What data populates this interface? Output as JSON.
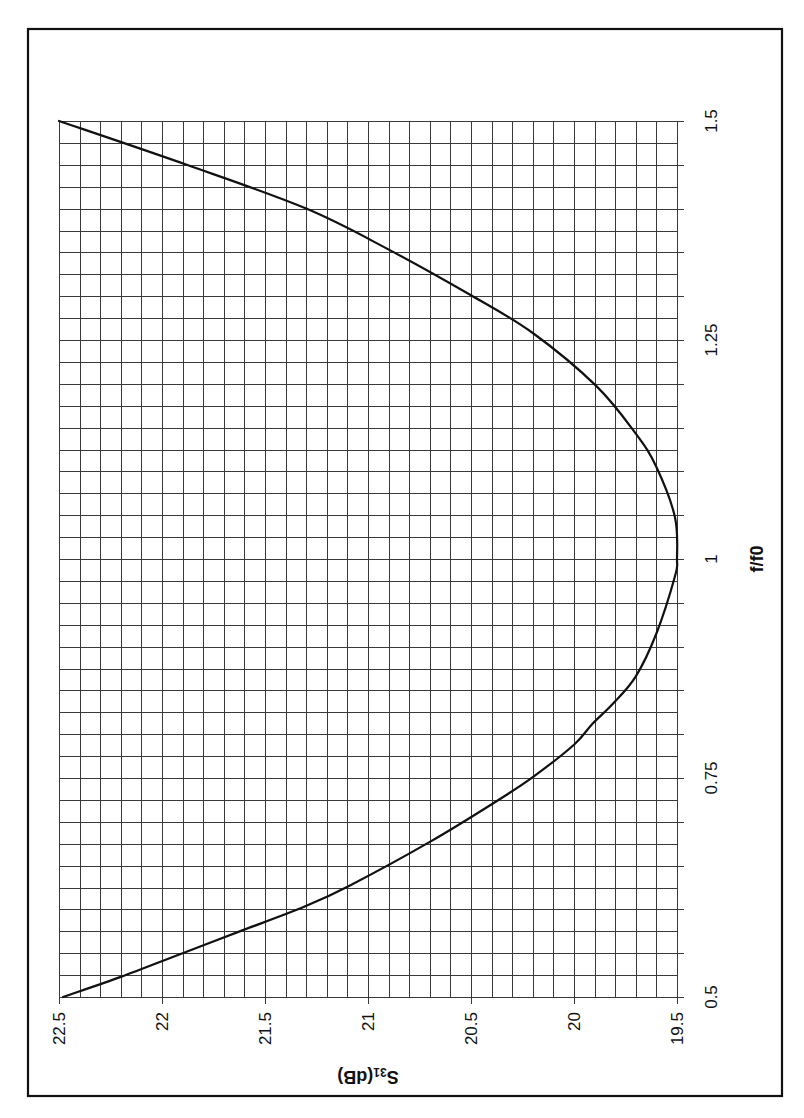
{
  "chart_data": {
    "type": "line",
    "title": "",
    "xlabel": "f/f0",
    "ylabel": "S31(dB)",
    "ylabel_main": "S",
    "ylabel_sub": "31",
    "ylabel_suffix": "(dB)",
    "xlim": [
      0.5,
      1.5
    ],
    "ylim": [
      19.5,
      22.5
    ],
    "x_ticks": [
      0.5,
      0.75,
      1,
      1.25,
      1.5
    ],
    "x_tick_labels": [
      "0.5",
      "0.75",
      "1",
      "1.25",
      "1.5"
    ],
    "y_ticks": [
      19.5,
      20,
      20.5,
      21,
      21.5,
      22,
      22.5
    ],
    "y_tick_labels": [
      "19.5",
      "20",
      "20.5",
      "21",
      "21.5",
      "22",
      "22.5"
    ],
    "x_minor_step": 0.025,
    "x_tick_step": 0.05,
    "y_minor_step": 0.1,
    "grid": true,
    "legend": null,
    "orientation": "rotated-90-ccw",
    "series": [
      {
        "name": "S31",
        "color": "#111111",
        "x": [
          0.5,
          0.523,
          0.55,
          0.576,
          0.603,
          0.627,
          0.677,
          0.723,
          0.751,
          0.788,
          0.812,
          0.835,
          0.866,
          0.915,
          0.98,
          1.0,
          1.048,
          1.105,
          1.143,
          1.197,
          1.258,
          1.301,
          1.352,
          1.4,
          1.45,
          1.5
        ],
        "values": [
          22.48,
          22.2,
          21.9,
          21.61,
          21.31,
          21.09,
          20.7,
          20.38,
          20.2,
          20.0,
          19.91,
          19.81,
          19.7,
          19.6,
          19.51,
          19.5,
          19.51,
          19.6,
          19.7,
          19.89,
          20.2,
          20.5,
          20.89,
          21.3,
          21.88,
          22.5
        ]
      }
    ]
  },
  "layout": {
    "frame": {
      "left": 28,
      "top": 29,
      "right": 782,
      "bottom": 1096
    },
    "plot": {
      "left": 59,
      "top": 121,
      "right": 677,
      "bottom": 997
    }
  }
}
